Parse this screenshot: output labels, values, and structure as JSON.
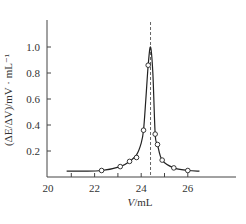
{
  "chart_data": {
    "type": "line",
    "title": "",
    "xlabel": "V/mL",
    "ylabel": "(ΔE/ΔV)/mV · mL⁻¹",
    "xlim": [
      20,
      28
    ],
    "ylim": [
      0,
      1.2
    ],
    "x_ticks": [
      20,
      22,
      24,
      26
    ],
    "y_ticks": [
      0.2,
      0.4,
      0.6,
      0.8,
      1.0
    ],
    "grid": false,
    "legend": null,
    "annotations": [
      {
        "type": "vertical-dashed-line",
        "x": 24.4
      }
    ],
    "series": [
      {
        "name": "measured points",
        "marker": "open-circle",
        "x": [
          22.3,
          23.1,
          23.5,
          23.8,
          24.1,
          24.3,
          24.6,
          24.7,
          24.9,
          25.4,
          26.0
        ],
        "y": [
          0.05,
          0.08,
          0.12,
          0.15,
          0.36,
          0.86,
          0.33,
          0.25,
          0.13,
          0.07,
          0.05
        ]
      },
      {
        "name": "fitted curve",
        "marker": "none",
        "x": [
          20.8,
          21.5,
          22.3,
          23.1,
          23.5,
          23.8,
          24.0,
          24.1,
          24.2,
          24.3,
          24.4,
          24.5,
          24.6,
          24.7,
          24.9,
          25.4,
          26.0,
          26.5
        ],
        "y": [
          0.045,
          0.045,
          0.05,
          0.08,
          0.12,
          0.17,
          0.26,
          0.36,
          0.6,
          0.86,
          1.0,
          0.8,
          0.33,
          0.25,
          0.13,
          0.07,
          0.05,
          0.045
        ]
      }
    ]
  },
  "labels": {
    "x_ticks": [
      "20",
      "22",
      "24",
      "26"
    ],
    "y_ticks": [
      "0.2",
      "0.4",
      "0.6",
      "0.8",
      "1.0"
    ],
    "xlabel": "V/mL",
    "ylabel": "(ΔE/ΔV)/mV · mL⁻¹"
  }
}
